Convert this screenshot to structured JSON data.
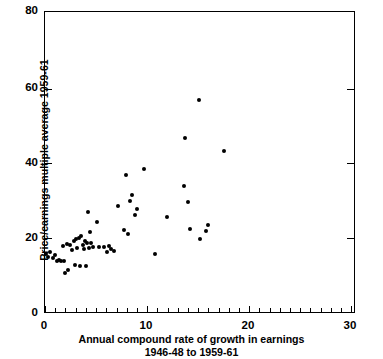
{
  "chart_data": {
    "type": "scatter",
    "title": "",
    "xlabel": "Annual compound rate of growth in earnings",
    "xlabel_line2": "1946-48 to 1959-61",
    "ylabel": "Price/earnings multiple average 1959-61",
    "xlim": [
      0,
      31
    ],
    "ylim": [
      0,
      80
    ],
    "xticks": [
      0,
      10,
      20,
      30
    ],
    "xticklabels": [
      "0",
      "10",
      "20",
      "30"
    ],
    "xminorticks": [
      1,
      2,
      3,
      4,
      5,
      6,
      7,
      8,
      9,
      11,
      12,
      13,
      14,
      15,
      16,
      17,
      18,
      19,
      21,
      22,
      23,
      24,
      25,
      26,
      27,
      28,
      29
    ],
    "yticks": [
      0,
      20,
      40,
      60,
      80
    ],
    "yticklabels": [
      "0",
      "20",
      "40",
      "60",
      "80"
    ],
    "grid": false,
    "legend": null,
    "marker": "filled-circle",
    "marker_color": "#000000",
    "points": [
      {
        "x": 0.1,
        "y": 15.6
      },
      {
        "x": 0.3,
        "y": 14.8
      },
      {
        "x": 0.5,
        "y": 16.0
      },
      {
        "x": 0.8,
        "y": 14.3
      },
      {
        "x": 1.0,
        "y": 15.3
      },
      {
        "x": 1.2,
        "y": 13.7
      },
      {
        "x": 1.4,
        "y": 14.0
      },
      {
        "x": 1.6,
        "y": 13.6
      },
      {
        "x": 1.8,
        "y": 17.6
      },
      {
        "x": 1.9,
        "y": 13.5
      },
      {
        "x": 2.0,
        "y": 10.4
      },
      {
        "x": 2.2,
        "y": 18.1
      },
      {
        "x": 2.3,
        "y": 11.2
      },
      {
        "x": 2.5,
        "y": 17.9
      },
      {
        "x": 2.7,
        "y": 16.6
      },
      {
        "x": 2.9,
        "y": 19.0
      },
      {
        "x": 3.0,
        "y": 12.5
      },
      {
        "x": 3.1,
        "y": 19.4
      },
      {
        "x": 3.2,
        "y": 17.2
      },
      {
        "x": 3.4,
        "y": 19.8
      },
      {
        "x": 3.5,
        "y": 12.4
      },
      {
        "x": 3.6,
        "y": 20.2
      },
      {
        "x": 3.8,
        "y": 18.0
      },
      {
        "x": 3.9,
        "y": 16.9
      },
      {
        "x": 4.0,
        "y": 19.0
      },
      {
        "x": 4.1,
        "y": 12.3
      },
      {
        "x": 4.2,
        "y": 18.5
      },
      {
        "x": 4.3,
        "y": 26.6
      },
      {
        "x": 4.4,
        "y": 17.0
      },
      {
        "x": 4.5,
        "y": 21.4
      },
      {
        "x": 4.6,
        "y": 18.4
      },
      {
        "x": 4.8,
        "y": 17.4
      },
      {
        "x": 5.2,
        "y": 23.9
      },
      {
        "x": 5.4,
        "y": 17.3
      },
      {
        "x": 5.9,
        "y": 17.3
      },
      {
        "x": 6.2,
        "y": 16.0
      },
      {
        "x": 6.4,
        "y": 17.5
      },
      {
        "x": 6.6,
        "y": 16.8
      },
      {
        "x": 6.9,
        "y": 16.3
      },
      {
        "x": 7.3,
        "y": 28.2
      },
      {
        "x": 7.9,
        "y": 21.8
      },
      {
        "x": 8.1,
        "y": 36.6
      },
      {
        "x": 8.3,
        "y": 20.9
      },
      {
        "x": 8.5,
        "y": 29.5
      },
      {
        "x": 8.7,
        "y": 31.2
      },
      {
        "x": 9.0,
        "y": 25.8
      },
      {
        "x": 9.2,
        "y": 27.6
      },
      {
        "x": 9.9,
        "y": 38.2
      },
      {
        "x": 11.0,
        "y": 15.6
      },
      {
        "x": 12.2,
        "y": 25.3
      },
      {
        "x": 13.9,
        "y": 33.6
      },
      {
        "x": 14.0,
        "y": 46.4
      },
      {
        "x": 14.3,
        "y": 29.4
      },
      {
        "x": 14.5,
        "y": 22.1
      },
      {
        "x": 15.4,
        "y": 56.5
      },
      {
        "x": 15.5,
        "y": 19.5
      },
      {
        "x": 16.2,
        "y": 21.5
      },
      {
        "x": 16.4,
        "y": 23.3
      },
      {
        "x": 18.0,
        "y": 43.0
      }
    ]
  }
}
